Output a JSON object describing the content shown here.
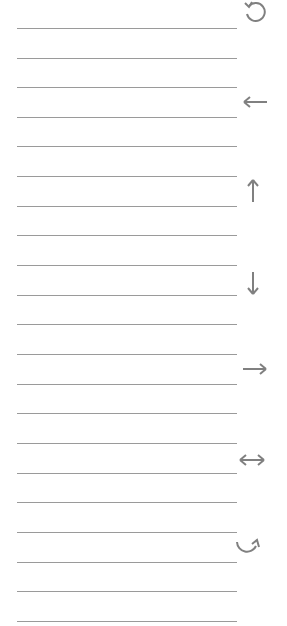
{
  "page": {
    "line_count": 21,
    "line_color": "#9a9a9a",
    "icon_color": "#808080"
  },
  "lines": [
    28,
    58,
    87,
    117,
    146,
    176,
    206,
    235,
    265,
    295,
    324,
    354,
    384,
    413,
    443,
    473,
    502,
    532,
    562,
    591,
    621
  ],
  "icons": [
    {
      "name": "refresh-icon",
      "x": 240,
      "y": -3
    },
    {
      "name": "arrow-left-icon",
      "x": 240,
      "y": 87
    },
    {
      "name": "arrow-up-icon",
      "x": 238,
      "y": 176
    },
    {
      "name": "arrow-down-icon",
      "x": 238,
      "y": 268
    },
    {
      "name": "arrow-right-icon",
      "x": 240,
      "y": 354
    },
    {
      "name": "arrow-left-right-icon",
      "x": 237,
      "y": 445
    },
    {
      "name": "curved-arrow-icon",
      "x": 234,
      "y": 534
    }
  ]
}
